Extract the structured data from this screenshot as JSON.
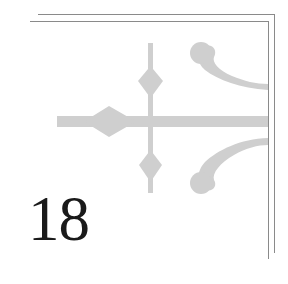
{
  "chapter": {
    "number": "18"
  },
  "ornament": {
    "name": "fleuron-corner-ornament",
    "color": "#cfcfcf"
  },
  "frame": {
    "rule_color": "#8a8a8a"
  }
}
